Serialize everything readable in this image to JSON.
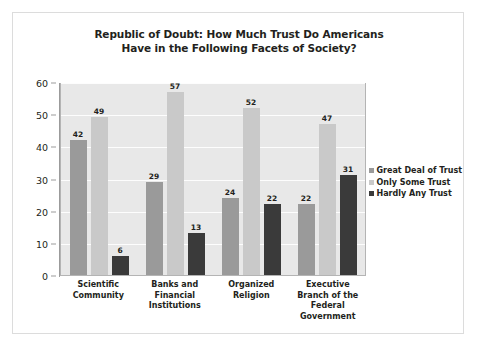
{
  "chart_data": {
    "type": "bar",
    "title": "Republic of Doubt: How Much Trust Do Americans Have in the Following Facets of Society?",
    "title_line1": "Republic of Doubt: How Much Trust Do Americans",
    "title_line2": "Have in the Following Facets of Society?",
    "xlabel": "",
    "ylabel": "",
    "ylim": [
      0,
      60
    ],
    "yticks": [
      0,
      10,
      20,
      30,
      40,
      50,
      60
    ],
    "grid": true,
    "legend_position": "right",
    "categories": [
      "Scientific Community",
      "Banks and Financial Institutions",
      "Organized Religion",
      "Executive Branch of the Federal Government"
    ],
    "category_lines": [
      [
        "Scientific",
        "Community"
      ],
      [
        "Banks and",
        "Financial",
        "Institutions"
      ],
      [
        "Organized",
        "Religion"
      ],
      [
        "Executive",
        "Branch of the",
        "Federal",
        "Government"
      ]
    ],
    "series": [
      {
        "name": "Great Deal of Trust",
        "color": "#9a9a9a",
        "values": [
          42,
          29,
          24,
          22
        ]
      },
      {
        "name": "Only Some Trust",
        "color": "#c9c9c9",
        "values": [
          49,
          57,
          52,
          47
        ]
      },
      {
        "name": "Hardly Any Trust",
        "color": "#3a3a3a",
        "values": [
          6,
          13,
          22,
          31
        ]
      }
    ]
  },
  "style": {
    "plot_background": "#e8e8e8",
    "gridline_color": "#fdfdfd",
    "axis_color": "#9b9b9b",
    "text_color": "#231f20",
    "frame_border": "#dcdcdc"
  }
}
